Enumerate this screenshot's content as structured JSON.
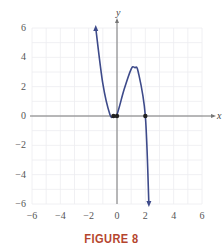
{
  "chart_data": {
    "type": "line",
    "title": "",
    "xlabel": "x",
    "ylabel": "y",
    "xlim": [
      -6,
      6
    ],
    "ylim": [
      -6,
      6
    ],
    "grid": true,
    "x_ticks": [
      -6,
      -4,
      -2,
      0,
      2,
      4,
      6
    ],
    "y_ticks": [
      -6,
      -4,
      -2,
      0,
      2,
      4,
      6
    ],
    "series": [
      {
        "name": "curve",
        "color": "#3d4a8a",
        "x": [
          -1.5,
          -1.0,
          -0.5,
          -0.25,
          0,
          0.5,
          1.0,
          1.25,
          1.5,
          2.0,
          2.25
        ],
        "y": [
          6.0,
          2.2,
          0.1,
          0.0,
          0.1,
          1.8,
          3.2,
          3.3,
          3.0,
          0.0,
          -6.0
        ],
        "end_arrows": true
      }
    ],
    "marked_points": [
      {
        "x": -0.25,
        "y": 0
      },
      {
        "x": 0,
        "y": 0
      },
      {
        "x": 2,
        "y": 0
      }
    ]
  },
  "caption": "FIGURE 8",
  "labels": {
    "x_axis": "x",
    "y_axis": "y"
  },
  "tick_labels": {
    "x": [
      "−6",
      "−4",
      "−2",
      "0",
      "2",
      "4",
      "6"
    ],
    "y": [
      "6",
      "4",
      "2",
      "0",
      "−2",
      "−4",
      "−6"
    ]
  }
}
